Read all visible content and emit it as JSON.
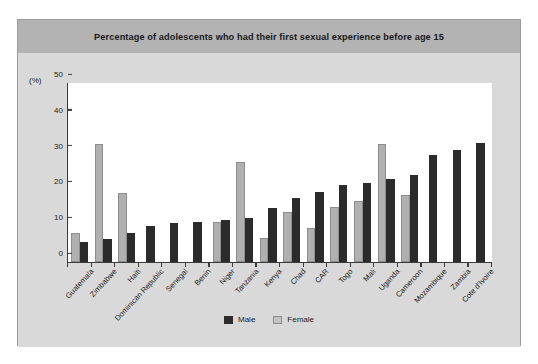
{
  "title": "Percentage of adolescents who had their first sexual experience before age 15",
  "axis_unit": "(%)",
  "legend": {
    "male": "Male",
    "female": "Female"
  },
  "colors": {
    "male": "#2b2b2b",
    "female": "#b0b0b0",
    "title_band": "#b3b3b3",
    "card": "#d9d9d9",
    "plot": "#ffffff"
  },
  "chart_data": {
    "type": "bar",
    "title": "Percentage of adolescents who had their first sexual experience before age 15",
    "xlabel": "",
    "ylabel": "(%)",
    "ylim": [
      0,
      50
    ],
    "yticks": [
      0,
      10,
      20,
      30,
      40,
      50
    ],
    "grid": false,
    "legend_position": "bottom-center",
    "categories": [
      "Guatemala",
      "Zimbabwe",
      "Haiti",
      "Dominican Republic",
      "Senegal",
      "Benin",
      "Niger",
      "Tanzania",
      "Kenya",
      "Chad",
      "CAR",
      "Togo",
      "Mali",
      "Uganda",
      "Cameroon",
      "Mozambique",
      "Zambia",
      "Cote d'Ivoire"
    ],
    "series": [
      {
        "name": "Male",
        "values": [
          5.5,
          6.5,
          8.0,
          10.0,
          10.8,
          11.1,
          11.8,
          12.2,
          15.0,
          18.0,
          19.6,
          21.5,
          22.0,
          23.3,
          24.2,
          29.8,
          31.3,
          33.3
        ]
      },
      {
        "name": "Female",
        "values": [
          8.0,
          33.0,
          19.2,
          0,
          0,
          0,
          11.2,
          27.8,
          6.8,
          13.9,
          9.4,
          15.3,
          17.0,
          33.0,
          18.8,
          0,
          0,
          0
        ]
      }
    ]
  }
}
